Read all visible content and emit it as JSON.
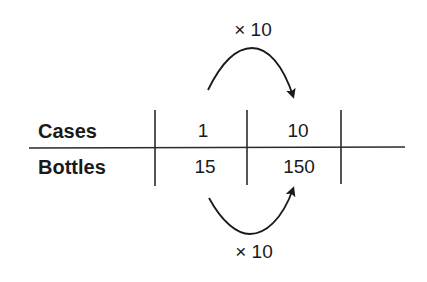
{
  "diagram": {
    "rows": [
      {
        "label": "Cases",
        "values": [
          "1",
          "10"
        ]
      },
      {
        "label": "Bottles",
        "values": [
          "15",
          "150"
        ]
      }
    ],
    "arrows": {
      "top": {
        "label": "× 10",
        "from": "Cases 1",
        "to": "Cases 10"
      },
      "bottom": {
        "label": "× 10",
        "from": "Bottles 15",
        "to": "Bottles 150"
      }
    },
    "colors": {
      "ink": "#1a1a1a",
      "background": "#ffffff"
    }
  }
}
